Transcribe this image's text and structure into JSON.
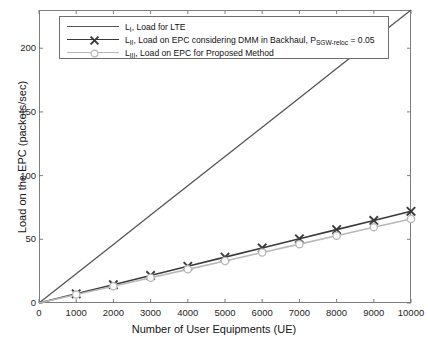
{
  "chart_data": {
    "type": "line",
    "title": "",
    "xlabel": "Number of User Equipments (UE)",
    "ylabel": "Load on the EPC (packets/sec)",
    "xlim": [
      0,
      10000
    ],
    "ylim": [
      0,
      230
    ],
    "xticks": [
      0,
      1000,
      2000,
      3000,
      4000,
      5000,
      6000,
      7000,
      8000,
      9000,
      10000
    ],
    "yticks": [
      0,
      50,
      100,
      150,
      200
    ],
    "grid": false,
    "legend_position": "top-left",
    "x": [
      0,
      1000,
      2000,
      3000,
      4000,
      5000,
      6000,
      7000,
      8000,
      9000,
      10000
    ],
    "series": [
      {
        "name": "L_I",
        "label_prefix": "L",
        "label_sub": "I",
        "label_text": ", Load for LTE",
        "color": "#555555",
        "marker": "none",
        "values": [
          0,
          23,
          46,
          69,
          92,
          115,
          138,
          161,
          184,
          207,
          230
        ]
      },
      {
        "name": "L_II",
        "label_prefix": "L",
        "label_sub": "II",
        "label_text": ", Load on EPC considering DMM in Backhaul, P",
        "label_sub2": "SGW-reloc",
        "label_tail": " = 0.05",
        "color": "#3a3a3a",
        "marker": "x",
        "values": [
          0,
          7.2,
          14.4,
          21.6,
          28.8,
          36,
          43.2,
          50.4,
          57.6,
          64.8,
          72
        ]
      },
      {
        "name": "L_III",
        "label_prefix": "L",
        "label_sub": "III",
        "label_text": ", Load on EPC for Proposed Method",
        "color": "#b8b8b8",
        "marker": "o",
        "values": [
          0,
          6.6,
          13.2,
          19.8,
          26.4,
          33,
          39.6,
          46.2,
          52.8,
          59.4,
          66
        ]
      }
    ]
  },
  "axis": {
    "xtick_labels": [
      "0",
      "1000",
      "2000",
      "3000",
      "4000",
      "5000",
      "6000",
      "7000",
      "8000",
      "9000",
      "10000"
    ],
    "ytick_labels": [
      "0",
      "50",
      "100",
      "150",
      "200"
    ],
    "xtitle": "Number of User Equipments (UE)",
    "ytitle": "Load on the EPC (packets/sec)"
  },
  "colors": {
    "axis": "#7d7d7d",
    "text": "#141414",
    "series_1": "#555555",
    "series_2": "#3a3a3a",
    "series_3": "#b8b8b8",
    "background": "#ffffff"
  }
}
